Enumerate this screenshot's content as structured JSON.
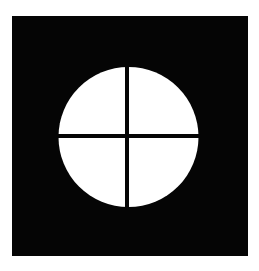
{
  "figure": {
    "background_color": "#ffffff",
    "square_color": "#050505",
    "circle_color": "#ffffff",
    "cross_color": "#050505",
    "quadrants": 4
  }
}
